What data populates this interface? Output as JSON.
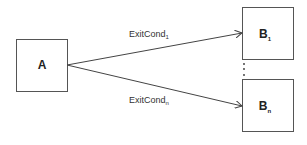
{
  "diagram": {
    "nodes": [
      {
        "id": "A",
        "label": "A",
        "sub": ""
      },
      {
        "id": "B1",
        "label": "B",
        "sub": "1"
      },
      {
        "id": "Bn",
        "label": "B",
        "sub": "n"
      }
    ],
    "edges": [
      {
        "from": "A",
        "to": "B1",
        "label": "ExitCond",
        "sub": "1"
      },
      {
        "from": "A",
        "to": "Bn",
        "label": "ExitCond",
        "sub": "n"
      }
    ],
    "ellipsis": "⋮",
    "colors": {
      "stroke": "#555555",
      "text": "#222222",
      "background": "#ffffff"
    }
  }
}
